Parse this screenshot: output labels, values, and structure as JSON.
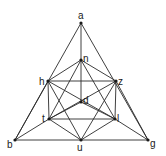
{
  "diagram": {
    "type": "graph",
    "vertices": [
      {
        "id": "a",
        "label": "a",
        "x": 81,
        "y": 23,
        "lx": 78,
        "ly": 19
      },
      {
        "id": "n",
        "label": "n",
        "x": 81,
        "y": 60,
        "lx": 83,
        "ly": 62
      },
      {
        "id": "h",
        "label": "h",
        "x": 48,
        "y": 81,
        "lx": 39,
        "ly": 85
      },
      {
        "id": "z",
        "label": "z",
        "x": 116,
        "y": 81,
        "lx": 118,
        "ly": 85
      },
      {
        "id": "d",
        "label": "d",
        "x": 81,
        "y": 102,
        "lx": 83,
        "ly": 104
      },
      {
        "id": "t",
        "label": "t",
        "x": 49,
        "y": 119,
        "lx": 42,
        "ly": 122
      },
      {
        "id": "l",
        "label": "l",
        "x": 115,
        "y": 119,
        "lx": 117,
        "ly": 122
      },
      {
        "id": "b",
        "label": "b",
        "x": 15,
        "y": 140,
        "lx": 7,
        "ly": 148
      },
      {
        "id": "u",
        "label": "u",
        "x": 81,
        "y": 140,
        "lx": 77,
        "ly": 151
      },
      {
        "id": "g",
        "label": "g",
        "x": 148,
        "y": 140,
        "lx": 150,
        "ly": 147
      }
    ],
    "edges": [
      [
        "a",
        "b"
      ],
      [
        "a",
        "g"
      ],
      [
        "b",
        "g"
      ],
      [
        "a",
        "n"
      ],
      [
        "n",
        "d"
      ],
      [
        "n",
        "h"
      ],
      [
        "n",
        "z"
      ],
      [
        "n",
        "t"
      ],
      [
        "n",
        "l"
      ],
      [
        "h",
        "z"
      ],
      [
        "h",
        "t"
      ],
      [
        "z",
        "l"
      ],
      [
        "t",
        "l"
      ],
      [
        "d",
        "t"
      ],
      [
        "d",
        "l"
      ],
      [
        "h",
        "u"
      ],
      [
        "z",
        "u"
      ],
      [
        "t",
        "u"
      ],
      [
        "l",
        "u"
      ],
      [
        "h",
        "l"
      ],
      [
        "z",
        "t"
      ],
      [
        "b",
        "h"
      ],
      [
        "b",
        "t"
      ],
      [
        "g",
        "z"
      ],
      [
        "g",
        "l"
      ]
    ]
  }
}
